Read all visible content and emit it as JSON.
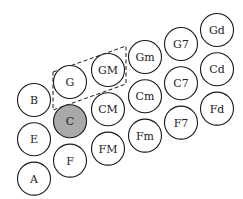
{
  "diagram": {
    "type": "chord-button-layout",
    "highlighted": "C",
    "highlight_color": "#a9a9a9",
    "grouped": [
      "G",
      "GM"
    ],
    "columns": [
      {
        "name": "bass-column",
        "notes": [
          "B",
          "E",
          "A"
        ]
      },
      {
        "name": "root-column",
        "notes": [
          "G",
          "C",
          "F"
        ]
      },
      {
        "name": "major-column",
        "notes": [
          "GM",
          "CM",
          "FM"
        ]
      },
      {
        "name": "minor-column",
        "notes": [
          "Gm",
          "Cm",
          "Fm"
        ]
      },
      {
        "name": "seventh-column",
        "notes": [
          "G7",
          "C7",
          "F7"
        ]
      },
      {
        "name": "diminished-column",
        "notes": [
          "Gd",
          "Cd",
          "Fd"
        ]
      }
    ]
  }
}
